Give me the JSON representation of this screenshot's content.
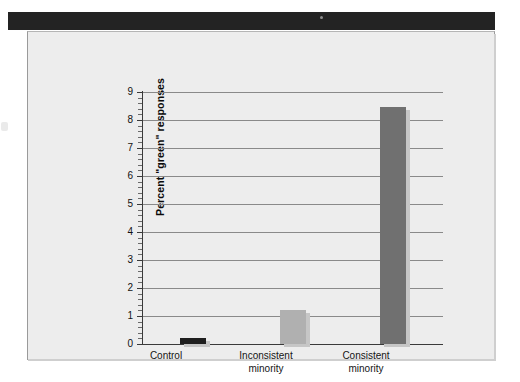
{
  "figure": {
    "panel_background": "#ededed",
    "header_band_color": "#232323"
  },
  "chart_data": {
    "type": "bar",
    "title": "",
    "xlabel": "",
    "ylabel": "Percent \"green\" responses",
    "categories": [
      "Control",
      "Inconsistent minority",
      "Consistent minority"
    ],
    "category_lines": [
      [
        "Control"
      ],
      [
        "Inconsistent",
        "minority"
      ],
      [
        "Consistent",
        "minority"
      ]
    ],
    "values": [
      0.22,
      1.2,
      8.45
    ],
    "bar_colors": [
      "#1f1f1f",
      "#b0b0b0",
      "#707070"
    ],
    "ylim": [
      0,
      9
    ],
    "y_ticks": [
      0,
      1,
      2,
      3,
      4,
      5,
      6,
      7,
      8,
      9
    ],
    "y_tick_labels": [
      "0",
      "1",
      "2",
      "3",
      "4",
      "5",
      "6",
      "7",
      "8",
      "9"
    ],
    "minor_ticks_per_interval": 4,
    "grid": true,
    "grid_axis": "y",
    "legend": false,
    "legend_position": "none"
  }
}
